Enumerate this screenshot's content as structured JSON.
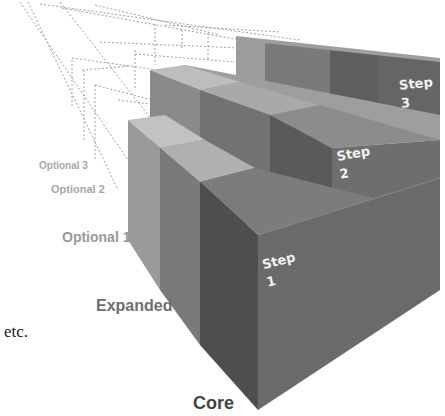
{
  "diagram": {
    "type": "3d-staircase",
    "tiers": [
      {
        "label": "Core",
        "color": "#444444",
        "size": 18
      },
      {
        "label": "Expanded",
        "color": "#6e6e6e",
        "size": 16
      },
      {
        "label": "Optional 1",
        "color": "#9a9a9a",
        "size": 14
      },
      {
        "label": "Optional 2",
        "color": "#a8a8a8",
        "size": 10
      },
      {
        "label": "Optional 3",
        "color": "#a8a8a8",
        "size": 10
      }
    ],
    "steps": [
      {
        "word": "Step",
        "number": "1"
      },
      {
        "word": "Step",
        "number": "2"
      },
      {
        "word": "Step",
        "number": "3"
      }
    ],
    "continuation": "etc.",
    "colors": {
      "front_face": "#5f5f5f",
      "top_face_light": "#b3b3b3",
      "dashed_outline": "#9a9a9a"
    }
  }
}
